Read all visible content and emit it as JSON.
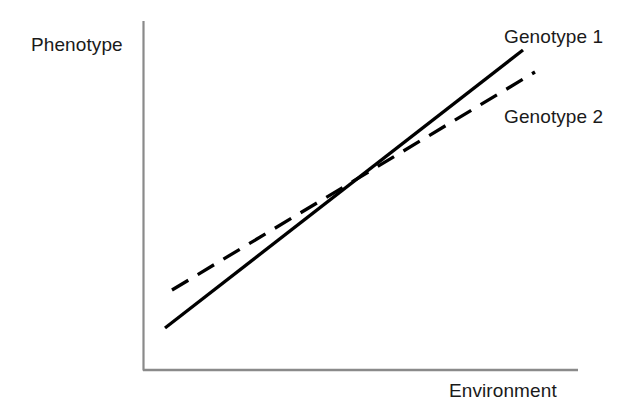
{
  "figure": {
    "width": 643,
    "height": 410,
    "background": "#ffffff"
  },
  "axes": {
    "y_axis_label": "Phenotype",
    "x_axis_label": "Environment",
    "axis_color": "#8a8a8a",
    "origin": {
      "x": 143,
      "y": 370
    },
    "y_axis_top": 21,
    "x_axis_right": 578
  },
  "series_labels": {
    "genotype_1": "Genotype 1",
    "genotype_2": "Genotype 2"
  },
  "chart_data": {
    "type": "line",
    "title": "",
    "xlabel": "Environment",
    "ylabel": "Phenotype",
    "xlim": [
      0,
      100
    ],
    "ylim": [
      0,
      100
    ],
    "grid": false,
    "legend_position": "right-of-line-ends",
    "axis_ticks": {
      "x": [],
      "y": []
    },
    "note": "Genotype-by-environment interaction: two genotypes with different reaction-norm slopes crossing near the middle of the environment range.",
    "series": [
      {
        "name": "Genotype 1",
        "style": "solid",
        "color": "#000000",
        "line_width_px": 3,
        "x": [
          5,
          100
        ],
        "values": [
          12,
          92
        ],
        "pixel_start": {
          "x": 165,
          "y": 328
        },
        "pixel_end": {
          "x": 523,
          "y": 50
        }
      },
      {
        "name": "Genotype 2",
        "style": "dashed",
        "color": "#000000",
        "line_width_px": 3,
        "dash_pattern": [
          19,
          11
        ],
        "x": [
          7,
          100
        ],
        "values": [
          23,
          85
        ],
        "pixel_start": {
          "x": 172,
          "y": 290
        },
        "pixel_end": {
          "x": 535,
          "y": 72
        }
      }
    ],
    "annotations": [
      {
        "text": "Genotype 1",
        "pixel": {
          "x": 504,
          "y": 26
        }
      },
      {
        "text": "Genotype 2",
        "pixel": {
          "x": 504,
          "y": 106
        }
      }
    ],
    "intersection": {
      "x_pixel": 345,
      "y_pixel": 192
    }
  }
}
